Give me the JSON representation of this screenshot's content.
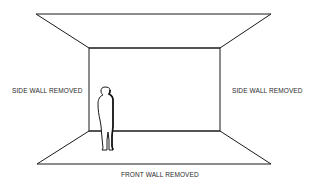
{
  "diagram": {
    "labels": {
      "left_wall": "SIDE WALL REMOVED",
      "right_wall": "SIDE WALL REMOVED",
      "front_wall": "FRONT WALL REMOVED"
    },
    "elements": [
      "ceiling-plane",
      "back-wall",
      "floor-plane",
      "human-figure"
    ],
    "colors": {
      "line": "#1a1a1a",
      "background": "#ffffff"
    }
  }
}
